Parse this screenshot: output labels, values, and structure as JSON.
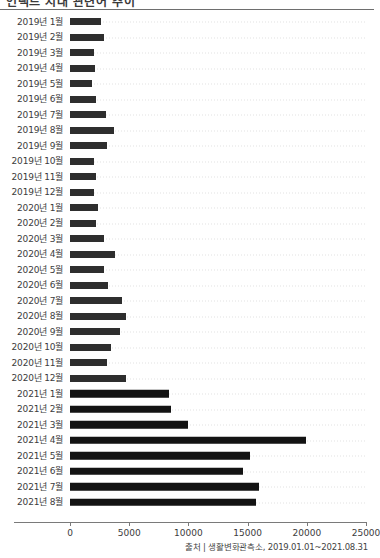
{
  "header": {
    "clipped_title": "언택트 시대 관련어 추이"
  },
  "source_note": "출처 | 생활변화관측소, 2019.01.01~2021.08.31",
  "chart_data": {
    "type": "bar",
    "orientation": "horizontal",
    "title": "",
    "subtitle": "",
    "xlabel": "",
    "ylabel": "",
    "xlim": [
      0,
      25000
    ],
    "ylim": null,
    "grid": true,
    "grid_axis": "y",
    "legend": false,
    "legend_position": "none",
    "bar_color": "#2e2e2e",
    "bar_color_recent": "#131313",
    "xticks": [
      0,
      5000,
      10000,
      15000,
      20000,
      25000
    ],
    "xtick_labels": [
      "0",
      "5000",
      "10000",
      "15000",
      "20000",
      "25000"
    ],
    "categories": [
      "2019년 1월",
      "2019년 2월",
      "2019년 3월",
      "2019년 4월",
      "2019년 5월",
      "2019년 6월",
      "2019년 7월",
      "2019년 8월",
      "2019년 9월",
      "2019년 10월",
      "2019년 11월",
      "2019년 12월",
      "2020년 1월",
      "2020년 2월",
      "2020년 3월",
      "2020년 4월",
      "2020년 5월",
      "2020년 6월",
      "2020년 7월",
      "2020년 8월",
      "2020년 9월",
      "2020년 10월",
      "2020년 11월",
      "2020년 12월",
      "2021년 1월",
      "2021년 2월",
      "2021년 3월",
      "2021년 4월",
      "2021년 5월",
      "2021년 6월",
      "2021년 7월",
      "2021년 8월"
    ],
    "values": [
      2600,
      2900,
      2000,
      2100,
      1900,
      2200,
      3000,
      3700,
      3100,
      2000,
      2200,
      2000,
      2400,
      2200,
      2900,
      3800,
      2900,
      3200,
      4400,
      4700,
      4200,
      3500,
      3100,
      4700,
      8400,
      8500,
      10000,
      19900,
      15200,
      14600,
      16000,
      15700
    ]
  }
}
